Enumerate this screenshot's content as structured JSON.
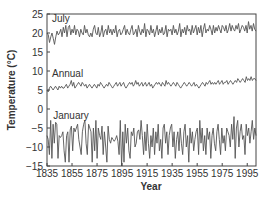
{
  "chart_data": {
    "type": "line",
    "title": "",
    "xlabel": "Year",
    "ylabel": "Temperature (°C)",
    "xlim": [
      1835,
      2002
    ],
    "ylim": [
      -15,
      25
    ],
    "grid": false,
    "legend": "inline labels",
    "x_ticks": [
      "1835",
      "1855",
      "1875",
      "1895",
      "1915",
      "1935",
      "1955",
      "1975",
      "1995"
    ],
    "y_ticks": [
      "-15",
      "-10",
      "-5",
      "0",
      "5",
      "10",
      "15",
      "20",
      "25"
    ],
    "series": [
      {
        "name": "July",
        "label_pos": [
          1839,
          23
        ],
        "values": [
          20,
          19.5,
          17.5,
          19,
          20,
          18.5,
          17,
          19,
          20.5,
          19.5,
          20,
          21,
          19,
          21.5,
          20,
          22,
          19,
          21.5,
          22,
          19.5,
          21,
          20,
          22,
          19.5,
          21,
          20.5,
          19,
          21,
          20,
          19.5,
          22,
          20,
          21,
          19.5,
          19,
          20,
          19,
          21,
          22,
          20,
          19.5,
          21.5,
          19,
          20,
          22,
          19,
          20.5,
          21,
          19.5,
          22,
          20,
          21,
          19.5,
          21,
          20,
          22,
          19,
          20.5,
          21,
          19.5,
          20,
          21,
          22,
          19.5,
          21,
          20,
          19.5,
          21,
          22,
          19.5,
          20,
          21,
          19,
          22,
          20.5,
          19.5,
          21,
          20,
          22.5,
          19,
          21,
          20.5,
          19.5,
          22,
          20,
          21,
          19,
          20.5,
          22,
          19.5,
          21,
          20,
          21.5,
          19.5,
          20,
          22,
          19,
          21,
          20.5,
          21,
          19.5,
          22,
          20,
          21,
          19.5,
          20.5,
          22.5,
          19,
          21,
          20,
          21.5,
          19.5,
          22,
          20.5,
          21,
          19.5,
          22,
          20,
          21,
          22,
          19.5,
          21.5,
          20,
          22,
          19,
          21,
          22.5,
          20,
          21,
          20.5,
          22,
          21,
          19.5,
          22,
          20,
          21.5,
          20.5,
          22,
          21,
          20,
          22,
          21.5,
          20.5,
          22,
          20,
          21,
          22.5,
          20.5,
          22,
          21,
          20.5,
          22,
          21,
          22.5,
          20,
          21,
          22,
          21.5,
          20.5,
          22,
          20,
          23,
          21,
          22,
          20.5,
          22.5,
          21,
          20.5
        ]
      },
      {
        "name": "Annual",
        "label_pos": [
          1839,
          8.5
        ],
        "values": [
          5,
          4.5,
          5.5,
          6,
          5.5,
          5,
          5.5,
          6,
          5.5,
          5,
          6,
          5.5,
          6,
          5.5,
          5.5,
          6,
          6.5,
          5.5,
          6,
          6.5,
          7.5,
          6,
          7,
          5.5,
          6,
          6.5,
          7,
          6.5,
          6,
          7,
          6.5,
          6,
          6.5,
          5.5,
          6,
          6.5,
          6,
          5.5,
          6,
          6.5,
          6,
          5.5,
          6.5,
          6,
          7,
          6.5,
          6,
          5.5,
          6,
          6.5,
          6,
          7,
          6.5,
          6,
          5.5,
          6,
          6.5,
          7,
          6,
          6.5,
          7,
          6,
          6.5,
          7,
          6,
          5.5,
          6,
          6.5,
          7,
          6.5,
          7,
          6,
          6.5,
          7.5,
          6.5,
          7,
          6,
          6.5,
          7,
          6,
          6.5,
          7,
          6,
          6.5,
          7,
          6,
          6.5,
          5.5,
          6,
          6.5,
          7,
          6.5,
          7,
          6.5,
          6,
          7,
          6.5,
          6,
          7.5,
          6.5,
          7,
          6.5,
          6,
          6.5,
          7,
          6.5,
          6,
          7,
          6.5,
          6,
          5.5,
          6,
          6.5,
          7,
          6.5,
          6,
          6.5,
          7,
          6.5,
          6,
          6.5,
          7,
          6,
          6.5,
          6,
          5.5,
          6,
          6.5,
          7,
          6.5,
          6,
          7,
          6.5,
          7,
          7.5,
          6.5,
          7,
          6.5,
          7,
          6.5,
          7,
          7.5,
          6.5,
          7,
          7.5,
          6.5,
          7,
          7,
          7.5,
          6.5,
          7,
          7.5,
          7,
          6.5,
          7,
          7.5,
          7,
          8,
          7.5,
          7,
          7.5,
          8,
          7.5,
          7,
          8.5,
          7.5,
          8,
          7.5,
          8.5,
          7.5,
          8,
          8,
          7.5
        ]
      },
      {
        "name": "January",
        "label_pos": [
          1840,
          -2.5
        ],
        "values": [
          -7,
          -8,
          -12,
          -3,
          -13,
          -4,
          -9,
          -3.5,
          -4,
          -13,
          -7,
          -7.5,
          -7,
          -6,
          -11,
          -14,
          -7,
          -6,
          -14,
          -5.5,
          -4.5,
          -11,
          -5,
          -6,
          -5,
          -4,
          -8,
          -10,
          -12,
          -6,
          -4,
          -3,
          -9,
          -12,
          -4,
          -5,
          -6,
          -14,
          -5,
          -11,
          -3,
          -13,
          -5,
          -7,
          -8,
          -4.5,
          -12,
          -6,
          -10,
          -14,
          -4.5,
          -8,
          -9,
          -7.5,
          -8,
          -8.5,
          -8,
          -7,
          -8.5,
          -12,
          -3,
          -15,
          -6,
          -14,
          -4,
          -9,
          -5,
          -11,
          -13,
          -6,
          -7,
          -5,
          -10,
          -9,
          -6,
          -5.5,
          -8,
          -3,
          -7,
          -12,
          -6,
          -11,
          -4,
          -9,
          -13,
          -7,
          -10,
          -5,
          -12,
          -6,
          -9,
          -4,
          -11,
          -8,
          -13,
          -5,
          -4,
          -9,
          -6,
          -12,
          -7,
          -5,
          -4,
          -10,
          -6,
          -13,
          -8,
          -6,
          -11,
          -5,
          -9,
          -12,
          -6,
          -4,
          -10,
          -7,
          -14,
          -5,
          -9,
          -6,
          -11,
          -8,
          -6,
          -5,
          -12,
          -3,
          -9,
          -5,
          -11,
          -7,
          -12,
          -5,
          -8,
          -6,
          -13,
          -7,
          -5,
          -9,
          -11,
          -6,
          -4,
          -8,
          -12,
          -5,
          -9,
          -7,
          -11,
          -5,
          -6,
          -7,
          -10,
          -4,
          -8,
          -2,
          -13,
          -5,
          -3,
          -10,
          -6,
          -4,
          -8,
          -7,
          -12,
          -4,
          -7,
          -5,
          -9,
          -6,
          -3,
          -8,
          -5,
          -7
        ]
      }
    ]
  }
}
